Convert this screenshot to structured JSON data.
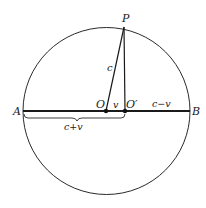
{
  "diagram": {
    "type": "geometry",
    "points": {
      "A": {
        "label": "A"
      },
      "B": {
        "label": "B"
      },
      "O": {
        "label": "O"
      },
      "O_prime": {
        "label": "O′"
      },
      "P": {
        "label": "P"
      }
    },
    "segment_labels": {
      "OP": "c",
      "OO_prime": "v",
      "O_prime_B": "c−v",
      "AO_prime_brace": "c+v"
    },
    "colors": {
      "stroke": "#2a2a2a",
      "background": "#ffffff"
    }
  }
}
